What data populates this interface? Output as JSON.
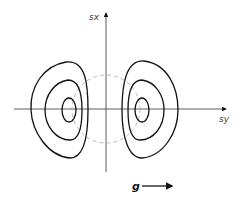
{
  "diagram": {
    "axes": {
      "vertical_label": "sx",
      "horizontal_label": "sy"
    },
    "vector_label": "g",
    "contours": {
      "left_lobe_levels": 3,
      "right_lobe_levels": 3
    },
    "reference_circle": "dashed"
  }
}
